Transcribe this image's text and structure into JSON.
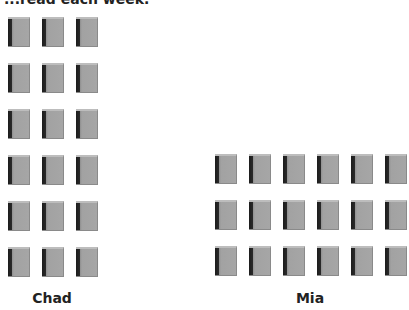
{
  "title": "...read each week.",
  "groups": [
    {
      "name": "Chad",
      "rows": 6,
      "cols": 3,
      "count": 18,
      "origin_x": 8,
      "origin_y": 17,
      "label_x": 52,
      "label_y": 290
    },
    {
      "name": "Mia",
      "rows": 3,
      "cols": 6,
      "count": 18,
      "origin_x": 215,
      "origin_y": 154,
      "label_x": 310,
      "label_y": 290
    }
  ],
  "layout": {
    "col_spacing": 34,
    "row_spacing": 46
  },
  "icon": "book-icon",
  "colors": {
    "book_body": "#a6a6a6",
    "book_spine": "#1c1c1c",
    "book_top": "#bdbdbd",
    "text": "#222222"
  }
}
